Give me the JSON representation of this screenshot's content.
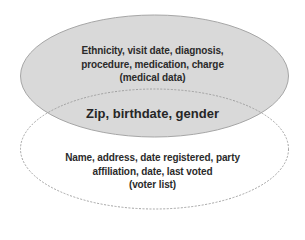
{
  "diagram": {
    "type": "venn",
    "sets": [
      {
        "id": "medical",
        "lines": [
          "Ethnicity, visit date, diagnosis,",
          "procedure, medication, charge",
          "(medical data)"
        ],
        "fill": "#d9d9d9",
        "stroke": "#a6a6a6",
        "style": "solid"
      },
      {
        "id": "voter",
        "lines": [
          "Name, address, date registered, party",
          "affiliation, date, last voted",
          "(voter list)"
        ],
        "fill": "none",
        "stroke": "#a6a6a6",
        "style": "dashed"
      }
    ],
    "intersection": {
      "label": "Zip, birthdate, gender"
    }
  }
}
